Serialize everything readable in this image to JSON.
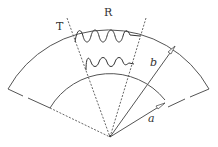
{
  "diagram": {
    "type": "annular-sector",
    "labels": {
      "T": "T",
      "R": "R",
      "b": "b",
      "a": "a"
    },
    "colors": {
      "stroke": "#555555",
      "background": "#ffffff"
    },
    "elements": [
      "outer-arc",
      "inner-arc",
      "dashed-radial-lines",
      "wavy-lines",
      "radius-arrow-a",
      "radius-arrow-b"
    ]
  }
}
